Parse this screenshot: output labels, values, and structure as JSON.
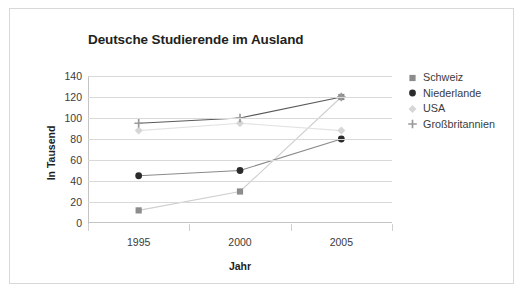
{
  "chart_data": {
    "type": "line",
    "title": "Deutsche Studierende im Ausland",
    "xlabel": "Jahr",
    "ylabel": "In Tausend",
    "categories": [
      "1995",
      "2000",
      "2005"
    ],
    "x": [
      1995,
      2000,
      2005
    ],
    "ylim": [
      0,
      140
    ],
    "yticks": [
      0,
      20,
      40,
      60,
      80,
      100,
      120,
      140
    ],
    "ytick_labels": [
      "0",
      "20",
      "40",
      "60",
      "80",
      "100",
      "120",
      "140"
    ],
    "grid": true,
    "legend_position": "right",
    "series": [
      {
        "name": "Schweiz",
        "marker": "square",
        "color": "#8c8c8c",
        "line_color": "#cfcfcf",
        "values": [
          12,
          30,
          120
        ]
      },
      {
        "name": "Niederlande",
        "marker": "circle",
        "color": "#2b2b2b",
        "line_color": "#8a8a8a",
        "values": [
          45,
          50,
          80
        ]
      },
      {
        "name": "USA",
        "marker": "diamond",
        "color": "#d6d6d6",
        "line_color": "#e2e2e2",
        "values": [
          88,
          95,
          88
        ]
      },
      {
        "name": "Großbritannien",
        "marker": "plus",
        "color": "#9a9a9a",
        "line_color": "#5a5a5a",
        "values": [
          95,
          100,
          120
        ]
      }
    ]
  },
  "legend": {
    "items": [
      {
        "label": "Schweiz"
      },
      {
        "label": "Niederlande"
      },
      {
        "label": "USA"
      },
      {
        "label": "Großbritannien"
      }
    ]
  },
  "colors": {
    "frame_border": "#d8d8d8",
    "gridline": "#d9d9d9",
    "axis": "#c4c4c4",
    "title_text": "#231f20",
    "tick_text": "#3b3b3b",
    "background": "#ffffff"
  }
}
